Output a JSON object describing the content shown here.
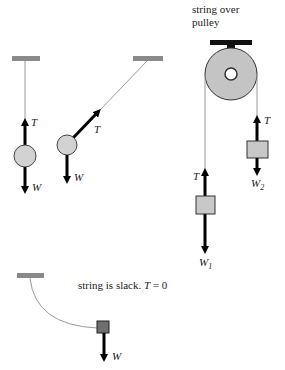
{
  "diagram": {
    "type": "free-body diagrams of tension in strings",
    "panels": [
      {
        "id": "vertical-hang",
        "labels": {
          "tension": "T",
          "weight": "W"
        }
      },
      {
        "id": "angled-hang",
        "labels": {
          "tension": "T",
          "weight": "W"
        }
      },
      {
        "id": "pulley",
        "caption_line1": "string over",
        "caption_line2": "pulley",
        "left_mass": {
          "tension": "T",
          "weight": "W",
          "weight_sub": "1"
        },
        "right_mass": {
          "tension": "T",
          "weight": "W",
          "weight_sub": "2"
        }
      },
      {
        "id": "slack-string",
        "caption": "string is slack. ",
        "caption_math": "T",
        "caption_eq": " = 0",
        "labels": {
          "weight": "W"
        }
      }
    ],
    "colors": {
      "ceiling": "#8a8a8a",
      "string": "#9a9a9a",
      "arrow": "#000000",
      "ball_fill": "#d2d2d2",
      "block_fill": "#c8c8c8",
      "dark_block_fill": "#6e6e6e",
      "pulley_fill": "#c4c4c4",
      "pulley_mount": "#111111"
    }
  }
}
